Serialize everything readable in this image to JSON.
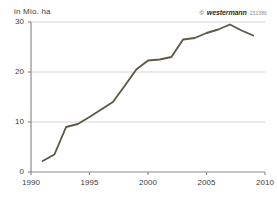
{
  "unit_label": "in Mio. ha",
  "watermark": {
    "copyright_symbol": "©",
    "brand": "westermann",
    "code": "231386"
  },
  "colors": {
    "line": "#5e5a47",
    "grid": "#d6d6d6",
    "axis": "#8c8c8c",
    "text": "#3b3b3b",
    "background": "#ffffff"
  },
  "chart_data": {
    "type": "line",
    "title": "",
    "subtitle": "",
    "xlabel": "",
    "ylabel": "in Mio. ha",
    "xlim": [
      1990,
      2010
    ],
    "ylim": [
      0,
      30
    ],
    "xticks": [
      1990,
      1995,
      2000,
      2005,
      2010
    ],
    "yticks": [
      0,
      10,
      20,
      30
    ],
    "xtick_labels": [
      "1990",
      "1995",
      "2000",
      "2005",
      "2010"
    ],
    "ytick_labels": [
      "0",
      "10",
      "20",
      "30"
    ],
    "grid": "horizontal",
    "legend": "none",
    "x": [
      1991,
      1992,
      1993,
      1994,
      1995,
      1996,
      1997,
      1998,
      1999,
      2000,
      2001,
      2002,
      2003,
      2004,
      2005,
      2006,
      2007,
      2008,
      2009
    ],
    "values": [
      2.2,
      3.5,
      9.0,
      9.6,
      11.0,
      12.5,
      14.0,
      17.2,
      20.5,
      22.3,
      22.5,
      23.0,
      26.5,
      26.8,
      27.8,
      28.5,
      29.5,
      28.3,
      27.3
    ],
    "series": [
      {
        "name": "Fläche",
        "values": [
          2.2,
          3.5,
          9.0,
          9.6,
          11.0,
          12.5,
          14.0,
          17.2,
          20.5,
          22.3,
          22.5,
          23.0,
          26.5,
          26.8,
          27.8,
          28.5,
          29.5,
          28.3,
          27.3
        ]
      }
    ]
  }
}
